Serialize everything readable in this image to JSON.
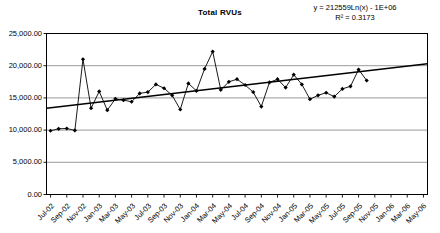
{
  "chart_data": {
    "type": "line",
    "title": "Total RVUs",
    "xlabel": "",
    "ylabel": "",
    "ylim": [
      0,
      25000
    ],
    "ytick_labels": [
      "25,000.00",
      "20,000.00",
      "15,000.00",
      "10,000.00",
      "5,000.00",
      "0.00"
    ],
    "ytick_values": [
      25000,
      20000,
      15000,
      10000,
      5000,
      0
    ],
    "grid": true,
    "legend": "none",
    "annotations": {
      "equation": "y = 212559Ln(x) - 1E+06",
      "r_squared": "R2 = 0.3173",
      "r_squared_display": "R² = 0.3173"
    },
    "categories": [
      "Jul-02",
      "Aug-02",
      "Sep-02",
      "Oct-02",
      "Nov-02",
      "Dec-02",
      "Jan-03",
      "Feb-03",
      "Mar-03",
      "Apr-03",
      "May-03",
      "Jun-03",
      "Jul-03",
      "Aug-03",
      "Sep-03",
      "Oct-03",
      "Nov-03",
      "Dec-03",
      "Jan-04",
      "Feb-04",
      "Mar-04",
      "Apr-04",
      "May-04",
      "Jun-04",
      "Jul-04",
      "Aug-04",
      "Sep-04",
      "Oct-04",
      "Nov-04",
      "Dec-04",
      "Jan-05",
      "Feb-05",
      "Mar-05",
      "Apr-05",
      "May-05",
      "Jun-05",
      "Jul-05",
      "Aug-05",
      "Sep-05",
      "Oct-05",
      "Nov-05",
      "Dec-05",
      "Jan-06",
      "Feb-06",
      "Mar-06",
      "Apr-06",
      "May-06"
    ],
    "xtick_labels": [
      "Jul-02",
      "Sep-02",
      "Nov-02",
      "Jan-03",
      "Mar-03",
      "May-03",
      "Jul-03",
      "Sep-03",
      "Nov-03",
      "Jan-04",
      "Mar-04",
      "May-04",
      "Jul-04",
      "Sep-04",
      "Nov-04",
      "Jan-05",
      "Mar-05",
      "May-05",
      "Jul-05",
      "Sep-05",
      "Nov-05",
      "Jan-06",
      "Mar-06",
      "May-06"
    ],
    "series": [
      {
        "name": "Total RVUs",
        "marker": "diamond",
        "values": [
          9900,
          10200,
          10250,
          9950,
          21000,
          13400,
          16000,
          13100,
          14850,
          14650,
          14400,
          15700,
          15900,
          17100,
          16500,
          15400,
          13200,
          17250,
          16100,
          19500,
          22200,
          16250,
          17500,
          17900,
          17000,
          15900,
          13650,
          17400,
          17900,
          16600,
          18600,
          17100,
          14800,
          15400,
          15800,
          15200,
          16400,
          16800,
          19400,
          17700,
          null,
          null,
          null,
          null,
          null,
          null,
          null
        ]
      }
    ],
    "trendline": {
      "type": "logarithmic",
      "equation": "y = 212559Ln(x) - 1E+06",
      "r_squared": 0.3173,
      "start_value": 13400,
      "end_value": 20300
    }
  }
}
